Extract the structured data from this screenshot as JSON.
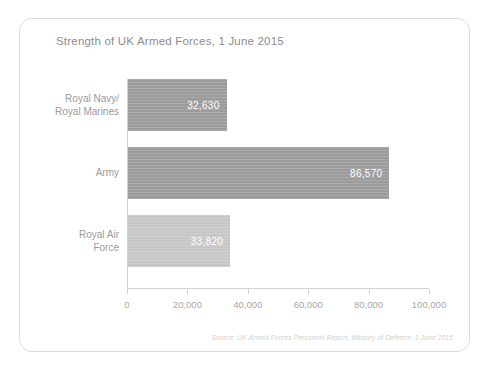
{
  "card": {
    "border_color": "#dcdcdc"
  },
  "chart_data": {
    "type": "bar",
    "orientation": "horizontal",
    "title": "Strength of UK Armed Forces, 1 June 2015",
    "xlabel": "",
    "ylabel": "",
    "categories": [
      "Royal Navy/\nRoyal Marines",
      "Army",
      "Royal Air\nForce"
    ],
    "values": [
      32630,
      86570,
      33820
    ],
    "value_labels": [
      "32,630",
      "86,570",
      "33,820"
    ],
    "bar_colors": [
      "#9b9b9b",
      "#9b9b9b",
      "#c6c6c6"
    ],
    "xlim": [
      0,
      100000
    ],
    "xticks": [
      0,
      20000,
      40000,
      60000,
      80000,
      100000
    ],
    "xtick_labels": [
      "0",
      "20,000",
      "40,000",
      "60,000",
      "80,000",
      "100,000"
    ],
    "grid": false,
    "legend": false,
    "axis_color": "#d2d2d2",
    "title_color": "#8c8c8c",
    "tick_label_color": "#a8a8a8",
    "category_label_color": "#9a9a9a",
    "value_label_color": "#ffffff"
  },
  "source": {
    "text": "Source: UK Armed Forces Personnel Report, Ministry of Defence, 1 June 2015"
  }
}
